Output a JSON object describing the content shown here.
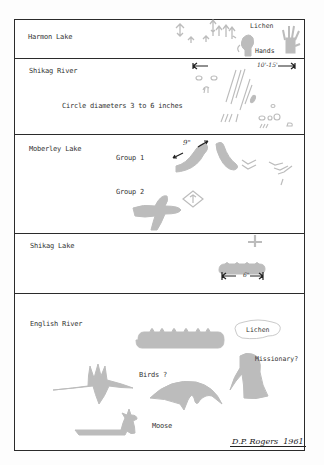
{
  "sections": [
    {
      "id": "harmon-lake",
      "title": "Harmon Lake",
      "annotations": [
        "Lichen",
        "Hands"
      ]
    },
    {
      "id": "shikag-river",
      "title": "Shikag River",
      "annotations": [
        "Circle diameters 3 to 6 inches"
      ],
      "dimension": "10'-15'"
    },
    {
      "id": "moberley-lake",
      "title": "Moberley Lake",
      "annotations": [
        "Group 1",
        "Group 2"
      ],
      "dimension": "9\""
    },
    {
      "id": "shikag-lake",
      "title": "Shikag Lake",
      "annotations": [],
      "dimension": "6\""
    },
    {
      "id": "english-river",
      "title": "English River",
      "annotations": [
        "Lichen",
        "Missionary?",
        "Birds ?",
        "Moose"
      ]
    }
  ],
  "signature": {
    "name": "D.P. Rogers",
    "year": "1961"
  },
  "colors": {
    "ink": "#2b2b2b",
    "pictograph": "#b9b9b9",
    "paper": "#ffffff"
  }
}
